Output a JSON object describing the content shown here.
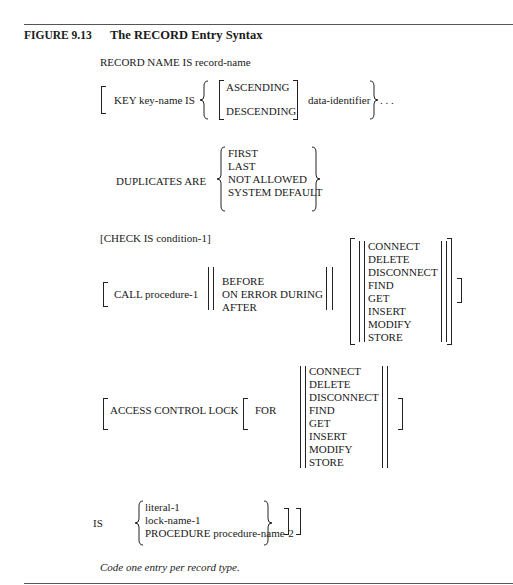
{
  "figure": {
    "label": "FIGURE 9.13",
    "title": "The RECORD Entry Syntax"
  },
  "syntax": {
    "record_name": "RECORD NAME IS record-name",
    "key": {
      "prefix": "KEY key-name IS",
      "order_options": [
        "ASCENDING",
        "DESCENDING"
      ],
      "identifier": "data-identifier",
      "ellipsis": ". . ."
    },
    "duplicates": {
      "prefix": "DUPLICATES ARE",
      "options": [
        "FIRST",
        "LAST",
        "NOT ALLOWED",
        "SYSTEM DEFAULT"
      ]
    },
    "check": "[CHECK IS condition-1]",
    "call": {
      "prefix": "CALL procedure-1",
      "timing_options": [
        "BEFORE",
        "ON ERROR DURING",
        "AFTER"
      ],
      "operations": [
        "CONNECT",
        "DELETE",
        "DISCONNECT",
        "FIND",
        "GET",
        "INSERT",
        "MODIFY",
        "STORE"
      ]
    },
    "access_control": {
      "prefix": "ACCESS CONTROL LOCK",
      "for_label": "FOR",
      "operations": [
        "CONNECT",
        "DELETE",
        "DISCONNECT",
        "FIND",
        "GET",
        "INSERT",
        "MODIFY",
        "STORE"
      ]
    },
    "is_clause": {
      "prefix": "IS",
      "options": [
        "literal-1",
        "lock-name-1",
        "PROCEDURE procedure-name-2"
      ]
    }
  },
  "note": "Code one entry per record type."
}
